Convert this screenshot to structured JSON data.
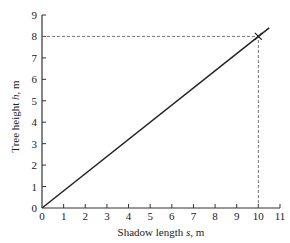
{
  "chart_data": {
    "type": "line",
    "title": "",
    "xlabel": "Shadow length s, m",
    "ylabel": "Tree height h, m",
    "xlim": [
      0,
      11
    ],
    "ylim": [
      0,
      9
    ],
    "xticks": [
      0,
      1,
      2,
      3,
      4,
      5,
      6,
      7,
      8,
      9,
      10,
      11
    ],
    "yticks": [
      0,
      1,
      2,
      3,
      4,
      5,
      6,
      7,
      8,
      9
    ],
    "grid": false,
    "series": [
      {
        "name": "h vs s",
        "x": [
          0,
          10.5
        ],
        "y": [
          0,
          8.4
        ],
        "style": "solid",
        "color": "#222222"
      }
    ],
    "annotations": [
      {
        "type": "marker",
        "symbol": "x",
        "x": 10,
        "y": 8
      },
      {
        "type": "dashed-guide",
        "from": [
          0,
          8
        ],
        "to": [
          10,
          8
        ]
      },
      {
        "type": "dashed-guide",
        "from": [
          10,
          0
        ],
        "to": [
          10,
          8
        ]
      }
    ]
  },
  "labels": {
    "xlabel_prefix": "Shadow length ",
    "xlabel_var": "s",
    "xlabel_suffix": ", m",
    "ylabel_prefix": "Tree height ",
    "ylabel_var": "h",
    "ylabel_suffix": ", m"
  }
}
